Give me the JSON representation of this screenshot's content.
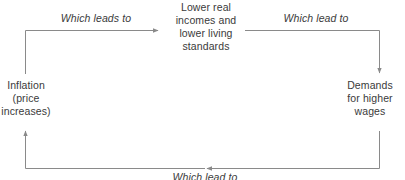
{
  "diagram": {
    "line_color": "#8a8a8a",
    "text_color": "#3a3a3a",
    "background_color": "#ffffff",
    "nodes": [
      {
        "id": "inflation",
        "label": "Inflation\n(price\nincreases)"
      },
      {
        "id": "lower-incomes",
        "label": "Lower real\nincomes and\nlower living\nstandards"
      },
      {
        "id": "wage-demands",
        "label": "Demands\nfor higher\nwages"
      }
    ],
    "edges": [
      {
        "id": "inflation-to-lower-incomes",
        "label": "Which leads to",
        "from": "inflation",
        "to": "lower-incomes"
      },
      {
        "id": "lower-incomes-to-wage-demands",
        "label": "Which lead to",
        "from": "lower-incomes",
        "to": "wage-demands"
      },
      {
        "id": "wage-demands-to-inflation",
        "label": "Which lead to",
        "from": "wage-demands",
        "to": "inflation"
      }
    ]
  }
}
